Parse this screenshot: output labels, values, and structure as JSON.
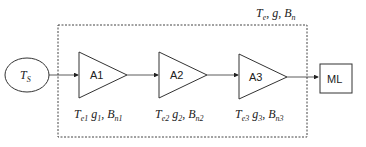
{
  "diagram": {
    "type": "cascaded amplifier chain",
    "source": {
      "label": "T",
      "sub": "S"
    },
    "system_label": {
      "parts": [
        {
          "t": "T",
          "sub": "e"
        },
        {
          "t": ", g, "
        },
        {
          "t": "B",
          "sub": "n"
        }
      ]
    },
    "amplifiers": [
      {
        "label": "A1",
        "params": {
          "te": "e1",
          "g": "1",
          "bn": "n1"
        }
      },
      {
        "label": "A2",
        "params": {
          "te": "e2",
          "g": "2",
          "bn": "n2"
        }
      },
      {
        "label": "A3",
        "params": {
          "te": "e3",
          "g": "3",
          "bn": "n3"
        }
      }
    ],
    "sink": {
      "label": "ML"
    },
    "colors": {
      "stroke": "#3a3a3a",
      "text": "#222222",
      "background": "#ffffff"
    }
  }
}
